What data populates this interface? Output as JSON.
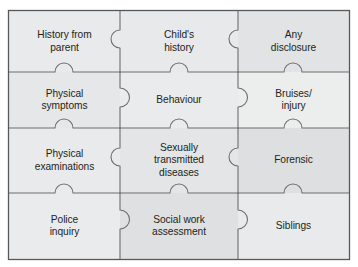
{
  "figure": {
    "name": "jigsaw-puzzle-diagram",
    "colors": {
      "page_background": "#ffffff",
      "frame_border": "#58595b",
      "piece_outline": "#6d6e71",
      "column_light": "#eceded",
      "column_mid": "#e3e4e5",
      "column_dark": "#dcdddf",
      "text": "#231f20"
    },
    "grid": {
      "columns": 3,
      "rows": 4,
      "column_dividers_x": [
        120,
        238
      ],
      "row_dividers_y": [
        72,
        128,
        193
      ],
      "frame": {
        "x": 8,
        "y": 10,
        "width": 342,
        "height": 250
      }
    }
  },
  "pieces": [
    {
      "id": "history-from-parent",
      "label": "History from\nparent",
      "row": 1,
      "column": 1,
      "fill": "#e9eaeb"
    },
    {
      "id": "childs-history",
      "label": "Child's\nhistory",
      "row": 1,
      "column": 2,
      "fill": "#e8e9ea"
    },
    {
      "id": "any-disclosure",
      "label": "Any\ndisclosure",
      "row": 1,
      "column": 3,
      "fill": "#e2e3e4"
    },
    {
      "id": "physical-symptoms",
      "label": "Physical\nsymptoms",
      "row": 2,
      "column": 1,
      "fill": "#e6e7e8"
    },
    {
      "id": "behaviour",
      "label": "Behaviour",
      "row": 2,
      "column": 2,
      "fill": "#eaebec"
    },
    {
      "id": "bruises-injury",
      "label": "Bruises/\ninjury",
      "row": 2,
      "column": 3,
      "fill": "#eceded"
    },
    {
      "id": "physical-examinations",
      "label": "Physical\nexaminations",
      "row": 3,
      "column": 1,
      "fill": "#e9eaeb"
    },
    {
      "id": "sexually-transmitted-diseases",
      "label": "Sexually\ntransmitted\ndiseases",
      "row": 3,
      "column": 2,
      "fill": "#e4e5e6"
    },
    {
      "id": "forensic",
      "label": "Forensic",
      "row": 3,
      "column": 3,
      "fill": "#dedfe1"
    },
    {
      "id": "police-inquiry",
      "label": "Police\ninquiry",
      "row": 4,
      "column": 1,
      "fill": "#eaebec"
    },
    {
      "id": "social-work-assessment",
      "label": "Social work\nassessment",
      "row": 4,
      "column": 2,
      "fill": "#dfe0e2"
    },
    {
      "id": "siblings",
      "label": "Siblings",
      "row": 4,
      "column": 3,
      "fill": "#e9eaeb"
    }
  ]
}
